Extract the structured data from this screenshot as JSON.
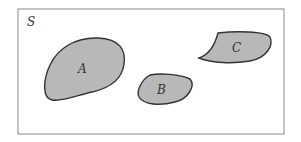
{
  "diagram": {
    "type": "venn",
    "universe_label": "S",
    "sets": [
      {
        "label": "A",
        "description": "large disjoint region"
      },
      {
        "label": "B",
        "description": "small disjoint region"
      },
      {
        "label": "C",
        "description": "disjoint region upper right"
      }
    ],
    "colors": {
      "fill": "#b8b8b8",
      "stroke": "#333333",
      "frame": "#888888"
    }
  }
}
